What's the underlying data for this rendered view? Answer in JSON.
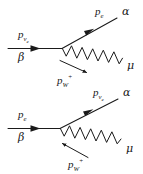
{
  "figure": {
    "type": "feynman-diagram-pair",
    "background_color": "#ffffff",
    "line_color": "#1a1a1a",
    "text_color": "#1a1a1a",
    "diagrams": [
      {
        "id": "top",
        "incoming": {
          "momentum_label": "p",
          "momentum_sub": "ν",
          "momentum_sub2": "e",
          "vertex_label": "β"
        },
        "outgoing_fermion": {
          "momentum_label": "p",
          "momentum_sub": "e",
          "vertex_label": "α"
        },
        "boson": {
          "momentum_label": "p",
          "momentum_sub": "W",
          "momentum_sup": "+",
          "end_label": "μ",
          "arrow_direction": "down-right"
        }
      },
      {
        "id": "bottom",
        "incoming": {
          "momentum_label": "p",
          "momentum_sub": "e",
          "momentum_sub2": "",
          "vertex_label": "β"
        },
        "outgoing_fermion": {
          "momentum_label": "p",
          "momentum_sub": "ν",
          "momentum_sub2": "e",
          "vertex_label": "α"
        },
        "boson": {
          "momentum_label": "p",
          "momentum_sub": "W",
          "momentum_sup": "+",
          "end_label": "μ",
          "arrow_direction": "up-left"
        }
      }
    ]
  }
}
